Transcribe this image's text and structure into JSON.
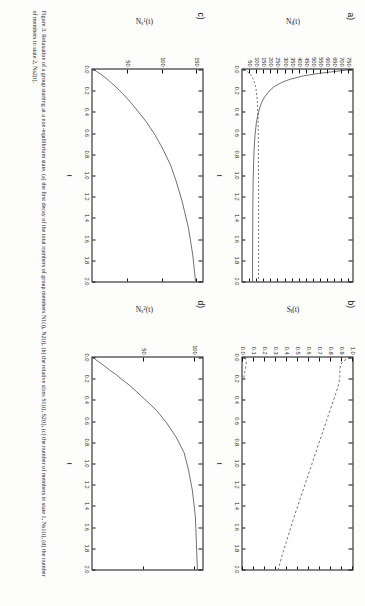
{
  "page": {
    "rotation_deg": 90,
    "background": "#fdfdfc",
    "ink": "#111111"
  },
  "caption": {
    "text": "Figure 3. Relaxation of a group starting at a non-equilibrium state. (a) the first decay of the total numbers of group members N1(t), N2(t), (b) the relative sizes S1(t), S2(t), (c) the number of members in state 1, Ns1(t), (d) the number of members in state 2, Ns2(t)."
  },
  "chart_data": [
    {
      "id": "a",
      "panel_label": "a)",
      "type": "line",
      "title": "",
      "xlabel": "t",
      "ylabel": "N_i(t)",
      "xlim": [
        0.0,
        2.0
      ],
      "ylim": [
        0,
        775
      ],
      "grid": false,
      "legend": "none",
      "xticks": [
        "0.0",
        "0.2",
        "0.4",
        "0.6",
        "0.8",
        "1.0",
        "1.2",
        "1.4",
        "1.6",
        "1.8",
        "2.0"
      ],
      "xtick_values": [
        0.0,
        0.2,
        0.4,
        0.6,
        0.8,
        1.0,
        1.2,
        1.4,
        1.6,
        1.8,
        2.0
      ],
      "yticks": [
        "50",
        "100",
        "150",
        "200",
        "250",
        "300",
        "350",
        "400",
        "450",
        "500",
        "550",
        "600",
        "650",
        "700",
        "750"
      ],
      "ytick_values": [
        50,
        100,
        150,
        200,
        250,
        300,
        350,
        400,
        450,
        500,
        550,
        600,
        650,
        700,
        750
      ],
      "series": [
        {
          "name": "N1(t)",
          "style": "solid",
          "x": [
            0.0,
            0.02,
            0.04,
            0.06,
            0.09,
            0.12,
            0.16,
            0.2,
            0.26,
            0.32,
            0.4,
            0.5,
            0.62,
            0.75,
            0.9,
            1.05,
            1.25,
            1.5,
            1.75,
            2.0
          ],
          "y": [
            770,
            640,
            520,
            430,
            340,
            280,
            225,
            190,
            155,
            132,
            113,
            98,
            88,
            82,
            78,
            75,
            73,
            72,
            71,
            71
          ]
        },
        {
          "name": "N2(t)",
          "style": "dashed",
          "x": [
            0.0,
            0.02,
            0.04,
            0.06,
            0.09,
            0.12,
            0.16,
            0.2,
            0.26,
            0.32,
            0.4,
            0.5,
            0.62,
            0.75,
            0.9,
            1.05,
            1.25,
            1.5,
            1.75,
            2.0
          ],
          "y": [
            10,
            34,
            52,
            64,
            76,
            84,
            92,
            97,
            102,
            105,
            108,
            110,
            111,
            112,
            112,
            113,
            113,
            113,
            113,
            113
          ]
        }
      ]
    },
    {
      "id": "b",
      "panel_label": "b)",
      "type": "line",
      "title": "",
      "xlabel": "t",
      "ylabel": "S_i(t)",
      "xlim": [
        0.0,
        2.0
      ],
      "ylim": [
        0.0,
        1.0
      ],
      "grid": false,
      "legend": "none",
      "xticks": [
        "0.0",
        "0.2",
        "0.4",
        "0.6",
        "0.8",
        "1.0",
        "1.2",
        "1.4",
        "1.6",
        "1.8",
        "2.0"
      ],
      "xtick_values": [
        0.0,
        0.2,
        0.4,
        0.6,
        0.8,
        1.0,
        1.2,
        1.4,
        1.6,
        1.8,
        2.0
      ],
      "yticks": [
        "0.0",
        "0.1",
        "0.2",
        "0.3",
        "0.4",
        "0.5",
        "0.6",
        "0.7",
        "0.8",
        "0.9",
        "1.0"
      ],
      "ytick_values": [
        0.0,
        0.1,
        0.2,
        0.3,
        0.4,
        0.5,
        0.6,
        0.7,
        0.8,
        0.9,
        1.0
      ],
      "series": [
        {
          "name": "S1(t)",
          "style": "dashed",
          "x": [
            0.0,
            0.03,
            0.07,
            0.12,
            0.18,
            0.25,
            0.35,
            0.5,
            0.7,
            0.9,
            1.1,
            1.3,
            1.5,
            1.7,
            1.85,
            2.0
          ],
          "y": [
            0.98,
            0.92,
            0.89,
            0.885,
            0.885,
            0.875,
            0.845,
            0.795,
            0.73,
            0.665,
            0.6,
            0.535,
            0.47,
            0.41,
            0.365,
            0.325
          ]
        },
        {
          "name": "S2(t)",
          "style": "dashed",
          "x": [
            0.0,
            0.02,
            0.05,
            0.09,
            0.14,
            0.2
          ],
          "y": [
            0.02,
            0.03,
            0.035,
            0.03,
            0.02,
            0.01
          ]
        }
      ]
    },
    {
      "id": "c",
      "panel_label": "c)",
      "type": "line",
      "title": "",
      "xlabel": "t",
      "ylabel": "N_s^1(t)",
      "xlim": [
        0.0,
        2.0
      ],
      "ylim": [
        0,
        158
      ],
      "grid": false,
      "legend": "none",
      "xticks": [
        "0.0",
        "0.2",
        "0.4",
        "0.6",
        "0.8",
        "1.0",
        "1.2",
        "1.4",
        "1.6",
        "1.8",
        "2.0"
      ],
      "xtick_values": [
        0.0,
        0.2,
        0.4,
        0.6,
        0.8,
        1.0,
        1.2,
        1.4,
        1.6,
        1.8,
        2.0
      ],
      "yticks": [
        "50",
        "100",
        "150"
      ],
      "ytick_values": [
        50,
        100,
        150
      ],
      "series": [
        {
          "name": "Ns1(t)",
          "style": "solid",
          "x": [
            0.0,
            0.02,
            0.04,
            0.06,
            0.09,
            0.12,
            0.16,
            0.2,
            0.26,
            0.32,
            0.4,
            0.5,
            0.62,
            0.75,
            0.9,
            1.05,
            1.25,
            1.5,
            1.75,
            2.0
          ],
          "y": [
            2,
            6,
            11,
            15,
            21,
            26,
            33,
            39,
            48,
            56,
            66,
            78,
            90,
            101,
            112,
            120,
            129,
            138,
            144,
            148
          ]
        }
      ]
    },
    {
      "id": "d",
      "panel_label": "d)",
      "type": "line",
      "title": "",
      "xlabel": "t",
      "ylabel": "N_s^2(t)",
      "xlim": [
        0.0,
        2.0
      ],
      "ylim": [
        0,
        108
      ],
      "grid": false,
      "legend": "none",
      "xticks": [
        "0.0",
        "0.2",
        "0.4",
        "0.6",
        "0.8",
        "1.0",
        "1.2",
        "1.4",
        "1.6",
        "1.8",
        "2.0"
      ],
      "xtick_values": [
        0.0,
        0.2,
        0.4,
        0.6,
        0.8,
        1.0,
        1.2,
        1.4,
        1.6,
        1.8,
        2.0
      ],
      "yticks": [
        "50",
        "100"
      ],
      "ytick_values": [
        50,
        100
      ],
      "series": [
        {
          "name": "Ns2(t)",
          "style": "solid",
          "x": [
            0.0,
            0.02,
            0.04,
            0.06,
            0.09,
            0.12,
            0.16,
            0.2,
            0.26,
            0.32,
            0.4,
            0.5,
            0.62,
            0.75,
            0.9,
            1.05,
            1.25,
            1.5,
            1.75,
            2.0
          ],
          "y": [
            1,
            3,
            6,
            9,
            13,
            17,
            23,
            28,
            36,
            43,
            52,
            63,
            73,
            82,
            90,
            94,
            98,
            101,
            102,
            103
          ]
        }
      ]
    }
  ]
}
